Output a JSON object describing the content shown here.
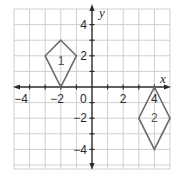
{
  "graph": {
    "x_axis_label": "x",
    "y_axis_label": "y",
    "origin_label": "0",
    "x_tick_labels": [
      "−4",
      "−2",
      "2",
      "4"
    ],
    "y_tick_labels": [
      "4",
      "2",
      "−2",
      "−4"
    ],
    "x_range": [
      -5,
      5
    ],
    "y_range": [
      -5,
      5
    ],
    "grid_step": 1
  },
  "figures": [
    {
      "label": "1",
      "shape": "kite",
      "vertices": [
        [
          -2,
          3
        ],
        [
          -1,
          2
        ],
        [
          -2,
          0
        ],
        [
          -3,
          2
        ]
      ],
      "label_position": [
        -2,
        1.7
      ]
    },
    {
      "label": "2",
      "shape": "rhombus",
      "vertices": [
        [
          4,
          0
        ],
        [
          5,
          -2
        ],
        [
          4,
          -4
        ],
        [
          3,
          -2
        ]
      ],
      "label_position": [
        4,
        -2
      ]
    }
  ],
  "colors": {
    "grid": "#cfcfcf",
    "axis": "#2a2a2a",
    "shape_stroke": "#6a6a6a"
  }
}
